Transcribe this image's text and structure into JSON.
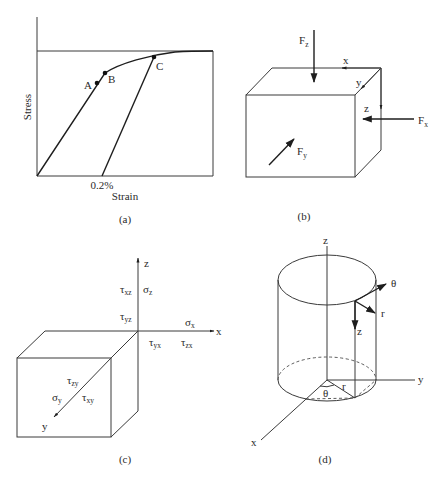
{
  "figure": {
    "panels": [
      {
        "id": "a",
        "caption": "(a)",
        "type": "stress-strain curve",
        "ylabel": "Stress",
        "xlabel": "Strain",
        "offset_label": "0.2%",
        "points": [
          {
            "name": "A",
            "label": "A"
          },
          {
            "name": "B",
            "label": "B"
          },
          {
            "name": "C",
            "label": "C"
          }
        ]
      },
      {
        "id": "b",
        "caption": "(b)",
        "type": "force components on cube",
        "forces": [
          {
            "sym": "F",
            "sub": "z"
          },
          {
            "sym": "F",
            "sub": "x"
          },
          {
            "sym": "F",
            "sub": "y"
          }
        ],
        "axes": [
          "x",
          "y",
          "z"
        ]
      },
      {
        "id": "c",
        "caption": "(c)",
        "type": "stress components",
        "axes": [
          "x",
          "y",
          "z"
        ],
        "components": [
          {
            "sym": "τ",
            "sub": "xz"
          },
          {
            "sym": "σ",
            "sub": "z"
          },
          {
            "sym": "τ",
            "sub": "yz"
          },
          {
            "sym": "σ",
            "sub": "x"
          },
          {
            "sym": "τ",
            "sub": "yx"
          },
          {
            "sym": "τ",
            "sub": "zx"
          },
          {
            "sym": "τ",
            "sub": "zy"
          },
          {
            "sym": "σ",
            "sub": "y"
          },
          {
            "sym": "τ",
            "sub": "xy"
          }
        ]
      },
      {
        "id": "d",
        "caption": "(d)",
        "type": "cylindrical coordinates",
        "axes": [
          "x",
          "y",
          "z"
        ],
        "local_axes": [
          "θ",
          "r",
          "z"
        ],
        "base_labels": [
          "θ",
          "r"
        ]
      }
    ]
  }
}
